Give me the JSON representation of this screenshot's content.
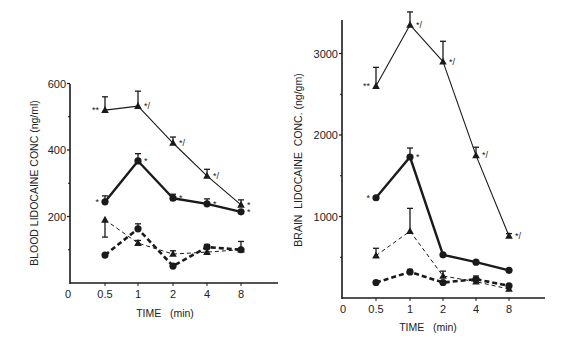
{
  "chart_data": [
    {
      "type": "line",
      "title": "",
      "xlabel": "TIME   (min)",
      "ylabel": "BLOOD LIDOCAINE CONC (ng/ml)",
      "x": [
        0.5,
        1,
        2,
        4,
        8
      ],
      "x_tick_labels": [
        "0",
        "0.5",
        "1",
        "2",
        "4",
        "8"
      ],
      "y_ticks": [
        200,
        400,
        600
      ],
      "y_minor_ticks": [
        100,
        300,
        500
      ],
      "ylim": [
        0,
        600
      ],
      "grid": false,
      "legend": null,
      "series": [
        {
          "name": "thin solid triangles",
          "style": "thin-solid",
          "marker": "triangle",
          "values": [
            520,
            532,
            421,
            322,
            235
          ],
          "err_plus": [
            40,
            45,
            18,
            20,
            15
          ],
          "annotations": [
            "**",
            "*/",
            "*/",
            "*/",
            "*"
          ]
        },
        {
          "name": "thick solid circles",
          "style": "thick-solid",
          "marker": "circle",
          "values": [
            244,
            367,
            255,
            238,
            214
          ],
          "err_plus": [
            18,
            22,
            12,
            15,
            0
          ],
          "annotations": [
            "*",
            "*",
            "*",
            "*",
            "*"
          ]
        },
        {
          "name": "thin dashed triangles",
          "style": "thin-dashed",
          "marker": "triangle",
          "values": [
            190,
            120,
            87,
            93,
            100
          ],
          "err_minus": [
            52,
            0,
            0,
            0,
            0
          ],
          "err_plus": [
            0,
            8,
            10,
            0,
            25
          ],
          "annotations": [
            "",
            "",
            "",
            "",
            ""
          ]
        },
        {
          "name": "thick dashed circles",
          "style": "thick-dashed",
          "marker": "circle",
          "values": [
            84,
            163,
            51,
            108,
            100
          ],
          "err_plus": [
            0,
            15,
            0,
            8,
            0
          ],
          "annotations": [
            "",
            "",
            "",
            "",
            ""
          ]
        }
      ]
    },
    {
      "type": "line",
      "title": "",
      "xlabel": "TIME   (min)",
      "ylabel": "BRAIN  LIDOCAINE  CONC. (ng/gm)",
      "x": [
        0.5,
        1,
        2,
        4,
        8
      ],
      "x_tick_labels": [
        "0",
        "0.5",
        "1",
        "2",
        "4",
        "8"
      ],
      "y_ticks": [
        1000,
        2000,
        3000
      ],
      "y_minor_ticks": [
        500,
        1500,
        2500
      ],
      "ylim": [
        0,
        3450
      ],
      "grid": false,
      "legend": null,
      "series": [
        {
          "name": "thin solid triangles",
          "style": "thin-solid",
          "marker": "triangle",
          "values": [
            2600,
            3350,
            2900,
            1750,
            760
          ],
          "err_plus": [
            230,
            160,
            250,
            100,
            30
          ],
          "annotations": [
            "**",
            "*/",
            "*/",
            "*/",
            "*/"
          ]
        },
        {
          "name": "thick solid circles",
          "style": "thick-solid",
          "marker": "circle",
          "values": [
            1230,
            1730,
            530,
            440,
            340
          ],
          "err_plus": [
            0,
            110,
            0,
            0,
            0
          ],
          "annotations": [
            "*",
            "*",
            "",
            "",
            ""
          ]
        },
        {
          "name": "thin dashed triangles",
          "style": "thin-dashed",
          "marker": "triangle",
          "values": [
            520,
            820,
            270,
            200,
            110
          ],
          "err_plus": [
            90,
            280,
            60,
            40,
            0
          ],
          "annotations": [
            "",
            "",
            "",
            "",
            ""
          ]
        },
        {
          "name": "thick dashed circles",
          "style": "thick-dashed",
          "marker": "circle",
          "values": [
            190,
            320,
            190,
            230,
            150
          ],
          "err_plus": [
            0,
            30,
            0,
            40,
            0
          ],
          "annotations": [
            "",
            "",
            "",
            "",
            ""
          ]
        }
      ]
    }
  ],
  "layout": {
    "panels": [
      {
        "x_axis_y": 283,
        "y_axis_x": 70,
        "x_axis_end": 278,
        "y_axis_top": 84,
        "px_per_unit": 0.3325,
        "x0_px": 68,
        "xpos": [
          105,
          138,
          173,
          207,
          241
        ],
        "x_label_y": 298,
        "xlabel_x": 165,
        "xlabel_y": 317,
        "ylabel_x": 38,
        "ylabel_cy": 183
      },
      {
        "x_axis_y": 298,
        "y_axis_x": 342,
        "x_axis_end": 545,
        "y_axis_top": 20,
        "px_per_unit": 0.0815,
        "x0_px": 343,
        "xpos": [
          376,
          410,
          443,
          476,
          509
        ],
        "x_label_y": 313,
        "xlabel_x": 428,
        "xlabel_y": 331,
        "ylabel_x": 302,
        "ylabel_cy": 160
      }
    ],
    "colors": {
      "ink": "#1a1a1a",
      "background": "#ffffff"
    }
  }
}
